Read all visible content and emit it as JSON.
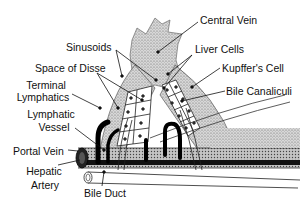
{
  "diagram": {
    "labels": {
      "central_vein": "Central Vein",
      "sinusoids": "Sinusoids",
      "liver_cells": "Liver Cells",
      "space_of_disse": "Space of Disse",
      "kupffers_cell": "Kupffer's Cell",
      "terminal_lymphatics_1": "Terminal",
      "terminal_lymphatics_2": "Lymphatics",
      "bile_canaliculi": "Bile Canaliculi",
      "lymphatic_vessel_1": "Lymphatic",
      "lymphatic_vessel_2": "Vessel",
      "portal_vein": "Portal Vein",
      "hepatic_artery_1": "Hepatic",
      "hepatic_artery_2": "Artery",
      "bile_duct": "Bile Duct"
    }
  }
}
